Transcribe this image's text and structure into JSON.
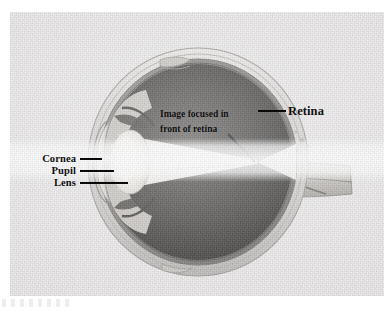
{
  "figure": {
    "background_color": "#ffffff",
    "photo_background_color": "#eceaea"
  },
  "labels": {
    "retina": "Retina",
    "cornea": "Cornea",
    "pupil": "Pupil",
    "lens": "Lens"
  },
  "annotation": {
    "line1": "Image focused in",
    "line2": "front of retina"
  },
  "colors": {
    "label_text": "#111111",
    "leader_line": "#0a0a0a",
    "vitreous_dark": "#3a3a3a",
    "sclera_light": "#d8d6d4",
    "lens_highlight": "#f2f0ec",
    "light_cone": "#f7f6f3"
  },
  "anatomy_parts": [
    "sclera",
    "retina",
    "choroid",
    "vitreous-humour",
    "cornea",
    "iris",
    "pupil",
    "lens",
    "ciliary-body",
    "optic-nerve",
    "extraocular-muscle-tendon-superior",
    "extraocular-muscle-tendon-inferior",
    "light-cone"
  ]
}
